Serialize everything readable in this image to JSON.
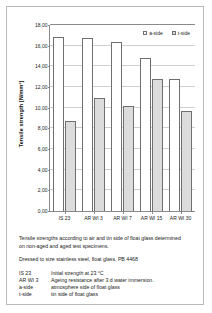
{
  "chart_data": {
    "type": "bar",
    "title": "",
    "xlabel": "",
    "ylabel": "Tensile strength  [N/mm²]",
    "ylim": [
      0,
      18
    ],
    "ytick_step": 2,
    "ytick_labels": [
      "0,00",
      "2,00",
      "4,00",
      "6,00",
      "8,00",
      "10,00",
      "12,00",
      "14,00",
      "16,00",
      "18,00"
    ],
    "ytick_values": [
      0,
      2,
      4,
      6,
      8,
      10,
      12,
      14,
      16,
      18
    ],
    "grid": true,
    "legend_position": "top-right",
    "categories": [
      "IS 23",
      "AR WI 3",
      "AR WI 7",
      "AR WI 15",
      "AR WI 30"
    ],
    "series": [
      {
        "name": "a-side",
        "color": "#ffffff",
        "values": [
          16.8,
          16.7,
          16.4,
          14.8,
          12.8
        ]
      },
      {
        "name": "t-side",
        "color": "#dcdcdc",
        "values": [
          8.75,
          10.9,
          10.2,
          12.8,
          9.65
        ]
      }
    ]
  },
  "legend": {
    "items": [
      {
        "label": "a-side",
        "swatch": "a-side"
      },
      {
        "label": "t-side",
        "swatch": "t-side"
      }
    ]
  },
  "caption": {
    "description_line_1": "Tensile strengths according to air and tin side of float glass determined",
    "description_line_2": "on non-aged and aged test specimens.",
    "specimen_line": "Dressed to size stainless steel, float glass, PB 4468",
    "key": [
      {
        "term": "IS 23",
        "desc": "Initial strength at 23 °C"
      },
      {
        "term": "AR WI 3",
        "desc": "Ageing resistance after 3 d water immersion."
      },
      {
        "term": "a-side",
        "desc": "atmosphere side of float glass"
      },
      {
        "term": "t-side",
        "desc": "tin side of float glass"
      }
    ]
  }
}
